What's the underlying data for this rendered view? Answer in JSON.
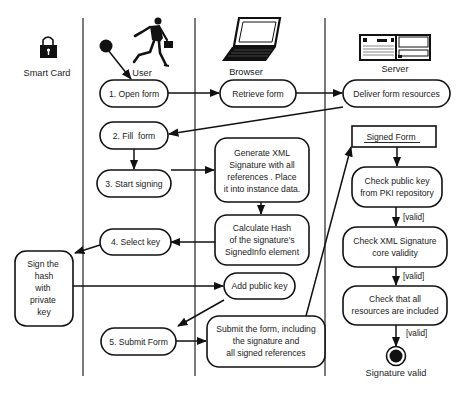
{
  "diagram": {
    "type": "UML activity diagram",
    "lanes": [
      {
        "id": "smart_card",
        "label": "Smart Card",
        "icon": "lock-icon"
      },
      {
        "id": "user",
        "label": "User",
        "icon": "running-businessman-icon"
      },
      {
        "id": "browser",
        "label": "Browser",
        "icon": "laptop-icon"
      },
      {
        "id": "server",
        "label": "Server",
        "icon": "server-icon"
      }
    ],
    "nodes": {
      "open_form": {
        "lane": "user",
        "lines": [
          "1. Open form"
        ]
      },
      "fill_form": {
        "lane": "user",
        "lines": [
          "2. Fill  form"
        ]
      },
      "start_signing": {
        "lane": "user",
        "lines": [
          "3. Start signing"
        ]
      },
      "select_key": {
        "lane": "user",
        "lines": [
          "4. Select key"
        ]
      },
      "submit_form": {
        "lane": "user",
        "lines": [
          "5. Submit Form"
        ]
      },
      "sign_hash": {
        "lane": "smart_card",
        "lines": [
          "Sign the",
          "hash",
          "with",
          "private",
          "key"
        ]
      },
      "retrieve_form": {
        "lane": "browser",
        "lines": [
          "Retrieve form"
        ]
      },
      "generate_xml": {
        "lane": "browser",
        "lines": [
          "Generate XML",
          "Signature with all",
          "references . Place",
          "it into instance data."
        ]
      },
      "calculate_hash": {
        "lane": "browser",
        "lines": [
          "Calculate Hash",
          "of the signature's",
          "SignedInfo element"
        ]
      },
      "add_public_key": {
        "lane": "browser",
        "lines": [
          "Add public key"
        ]
      },
      "submit_including": {
        "lane": "browser",
        "lines": [
          "Submit the form, including",
          "the signature and",
          "all signed references"
        ]
      },
      "deliver_resources": {
        "lane": "server",
        "lines": [
          "Deliver form resources"
        ]
      },
      "signed_form": {
        "lane": "server",
        "lines": [
          "Signed Form"
        ],
        "kind": "object"
      },
      "check_public_key": {
        "lane": "server",
        "lines": [
          "Check public key",
          "from PKI repository"
        ]
      },
      "check_xml_sig": {
        "lane": "server",
        "lines": [
          "Check XML Signature",
          "core validity"
        ]
      },
      "check_resources": {
        "lane": "server",
        "lines": [
          "Check that all",
          "resources are included"
        ]
      },
      "end": {
        "lane": "server",
        "label": "Signature valid",
        "kind": "final"
      }
    },
    "edges": [
      {
        "from": "start",
        "to": "open_form"
      },
      {
        "from": "open_form",
        "to": "retrieve_form"
      },
      {
        "from": "retrieve_form",
        "to": "deliver_resources"
      },
      {
        "from": "deliver_resources",
        "to": "fill_form"
      },
      {
        "from": "fill_form",
        "to": "start_signing"
      },
      {
        "from": "start_signing",
        "to": "generate_xml"
      },
      {
        "from": "generate_xml",
        "to": "calculate_hash"
      },
      {
        "from": "calculate_hash",
        "to": "select_key"
      },
      {
        "from": "select_key",
        "to": "sign_hash"
      },
      {
        "from": "sign_hash",
        "to": "add_public_key"
      },
      {
        "from": "add_public_key",
        "to": "submit_form"
      },
      {
        "from": "submit_form",
        "to": "submit_including"
      },
      {
        "from": "submit_including",
        "to": "signed_form"
      },
      {
        "from": "signed_form",
        "to": "check_public_key"
      },
      {
        "from": "check_public_key",
        "to": "check_xml_sig",
        "guard": "[valid]"
      },
      {
        "from": "check_xml_sig",
        "to": "check_resources",
        "guard": "[valid]"
      },
      {
        "from": "check_resources",
        "to": "end",
        "guard": "[valid]"
      }
    ],
    "guards": [
      "[valid]",
      "[valid]",
      "[valid]"
    ]
  }
}
